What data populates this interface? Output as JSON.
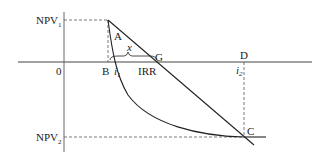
{
  "diagram": {
    "type": "NPV vs discount rate (IRR interpolation)",
    "colors": {
      "line": "#222222",
      "axis": "#555555",
      "dashed": "#555555",
      "background": "#ffffff"
    },
    "axes": {
      "origin_label": "0",
      "y_labels": [
        {
          "id": "npv1",
          "main": "NPV",
          "sub": "1"
        },
        {
          "id": "npv2",
          "main": "NPV",
          "sub": "2"
        }
      ]
    },
    "points": {
      "A": "A",
      "B": "B",
      "G": "G",
      "D": "D",
      "C": "C"
    },
    "annotations": {
      "i1_main": "i",
      "i1_sub": "1",
      "i2_main": "i",
      "i2_sub": "2",
      "irr": "IRR",
      "x": "x"
    }
  }
}
